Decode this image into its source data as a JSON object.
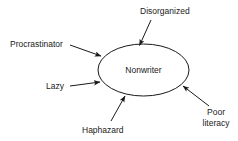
{
  "diagram": {
    "type": "concept-map",
    "center_node": {
      "label": "Nonwriter",
      "shape": "ellipse",
      "cx": 143.5,
      "cy": 70,
      "rx": 45.5,
      "ry": 26
    },
    "factors": [
      {
        "id": "disorganized",
        "label": "Disorganized",
        "position": "top-right",
        "text_x": 140,
        "text_y": 14,
        "arrow": {
          "x1": 151,
          "y1": 20,
          "x2": 139.5,
          "y2": 45.5
        }
      },
      {
        "id": "procrastinator",
        "label": "Procrastinator",
        "position": "left-upper",
        "text_x": 10,
        "text_y": 47,
        "arrow": {
          "x1": 70,
          "y1": 45,
          "x2": 101,
          "y2": 56
        }
      },
      {
        "id": "lazy",
        "label": "Lazy",
        "position": "left-lower",
        "text_x": 46,
        "text_y": 89,
        "arrow": {
          "x1": 70,
          "y1": 86,
          "x2": 100,
          "y2": 82
        }
      },
      {
        "id": "haphazard",
        "label": "Haphazard",
        "position": "bottom",
        "text_x": 82,
        "text_y": 133,
        "arrow": {
          "x1": 111,
          "y1": 121,
          "x2": 125,
          "y2": 96
        }
      },
      {
        "id": "poor-literacy",
        "label": "Poor literacy",
        "label_lines": [
          "Poor",
          "literacy"
        ],
        "position": "bottom-right",
        "text_x": 216,
        "text_y": 115,
        "arrow": {
          "x1": 209,
          "y1": 106,
          "x2": 183,
          "y2": 86
        }
      }
    ],
    "style": {
      "stroke_color": "#1a1a1a",
      "fill_color": "#ffffff",
      "text_color": "#1a1a1a",
      "background": "#ffffff",
      "stroke_width": 1
    }
  }
}
